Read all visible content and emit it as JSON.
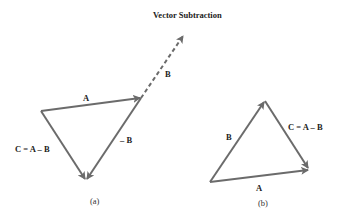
{
  "title": "Vector Subtraction",
  "colors": {
    "vector": "#6b6b6b",
    "text": "#222222"
  },
  "panel_a": {
    "caption": "(a)",
    "labels": {
      "A": "A",
      "neg_B": "– B",
      "B": "B",
      "C": "C = A – B"
    }
  },
  "panel_b": {
    "caption": "(b)",
    "labels": {
      "B": "B",
      "A": "A",
      "C": "C = A – B"
    }
  }
}
